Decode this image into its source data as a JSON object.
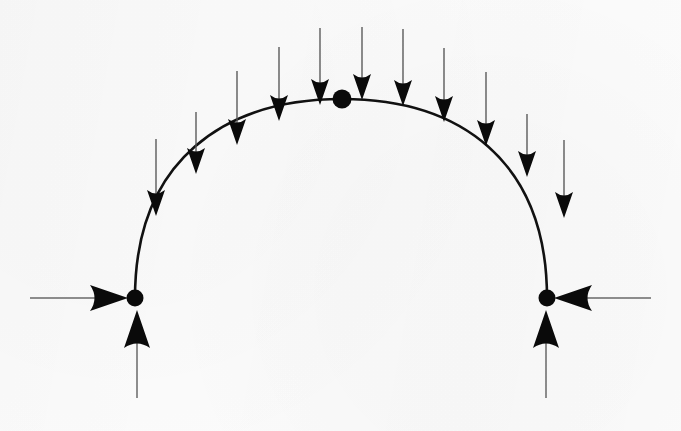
{
  "figure": {
    "type": "structural-free-body-diagram",
    "background_color": "#fbfbfb",
    "ink_color": "#0a0a0a",
    "shaft_color": "#555555",
    "canvas": {
      "width": 681,
      "height": 431
    }
  },
  "arch": {
    "name": "semicircular-arch-rib",
    "stroke_color": "#111111",
    "stroke_width": 2.6,
    "left_springing": {
      "x": 135,
      "y": 298
    },
    "right_springing": {
      "x": 547,
      "y": 298
    },
    "crown": {
      "x": 342,
      "y": 99
    },
    "span": 412,
    "rise": 199,
    "path": "M 135,298 C 135,160 225,99 342,99 C 459,99 547,160 547,298"
  },
  "nodes": [
    {
      "name": "left-support-node",
      "x": 135,
      "y": 298,
      "radius": 8.5
    },
    {
      "name": "crown-node",
      "x": 342,
      "y": 99,
      "radius": 9.5
    },
    {
      "name": "right-support-node",
      "x": 547,
      "y": 298,
      "radius": 8.5
    }
  ],
  "loads": {
    "name": "distributed-vertical-load",
    "direction": "down",
    "count": 11,
    "arrows": [
      {
        "x": 156,
        "tail_y": 139,
        "tip_y": 216
      },
      {
        "x": 196,
        "tail_y": 112,
        "tip_y": 174
      },
      {
        "x": 237,
        "tail_y": 71,
        "tip_y": 145
      },
      {
        "x": 279,
        "tail_y": 47,
        "tip_y": 121
      },
      {
        "x": 320,
        "tail_y": 28,
        "tip_y": 105
      },
      {
        "x": 362,
        "tail_y": 27,
        "tip_y": 100
      },
      {
        "x": 403,
        "tail_y": 29,
        "tip_y": 106
      },
      {
        "x": 444,
        "tail_y": 48,
        "tip_y": 122
      },
      {
        "x": 486,
        "tail_y": 72,
        "tip_y": 146
      },
      {
        "x": 527,
        "tail_y": 114,
        "tip_y": 177
      },
      {
        "x": 564,
        "tail_y": 140,
        "tip_y": 218
      }
    ]
  },
  "reactions": [
    {
      "name": "left-horizontal-thrust",
      "direction": "right",
      "tail": {
        "x": 30,
        "y": 298
      },
      "tip": {
        "x": 128,
        "y": 298
      }
    },
    {
      "name": "left-vertical-reaction",
      "direction": "up",
      "tail": {
        "x": 137,
        "y": 398
      },
      "tip": {
        "x": 137,
        "y": 310
      }
    },
    {
      "name": "right-horizontal-thrust",
      "direction": "left",
      "tail": {
        "x": 651,
        "y": 298
      },
      "tip": {
        "x": 554,
        "y": 298
      }
    },
    {
      "name": "right-vertical-reaction",
      "direction": "up",
      "tail": {
        "x": 546,
        "y": 398
      },
      "tip": {
        "x": 546,
        "y": 310
      }
    }
  ],
  "labels": {
    "none_visible": ""
  }
}
